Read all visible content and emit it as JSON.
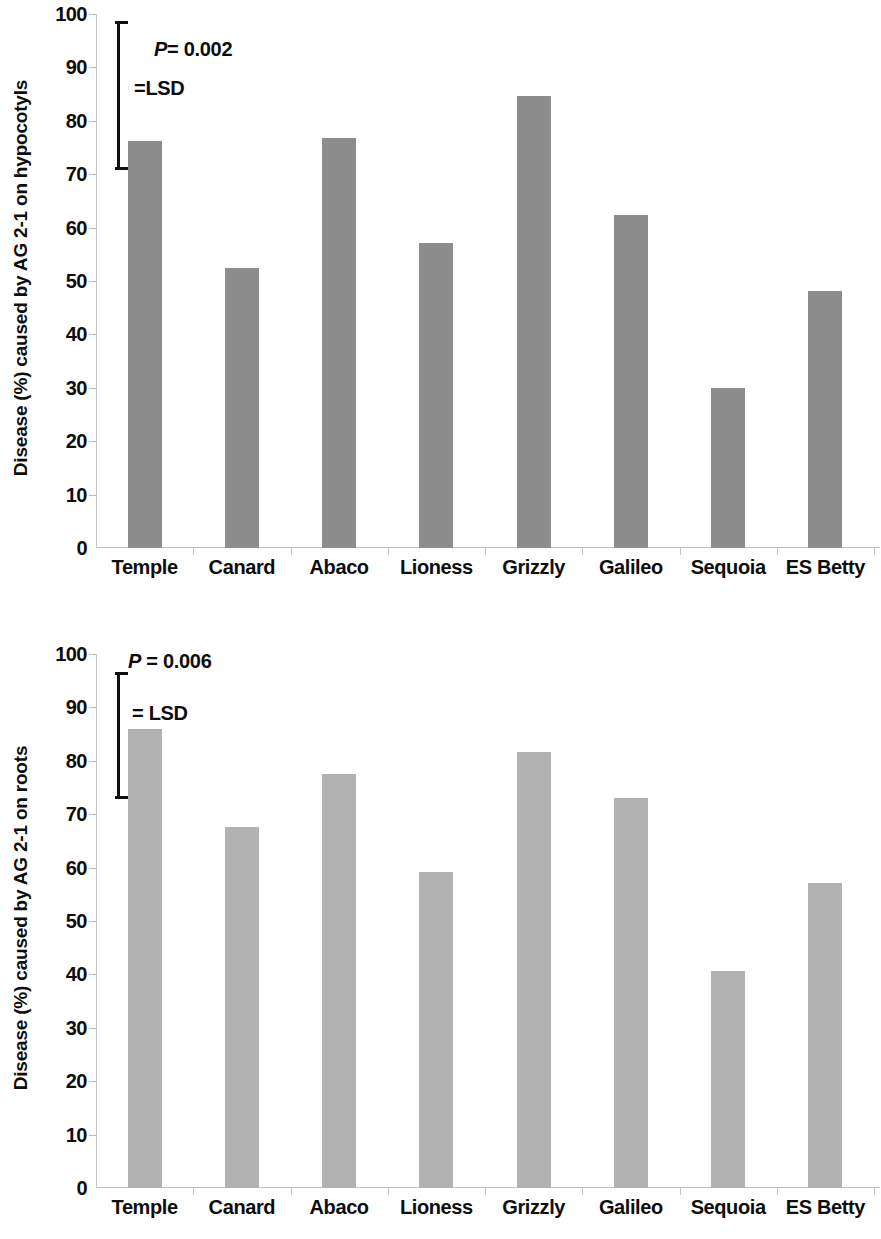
{
  "figures": [
    {
      "id": "hypocotyls",
      "ylabel": "Disease (%) caused by AG 2-1 on hypocotyls",
      "p_value_label": "P= 0.002",
      "p_italic": "P",
      "p_rest": "= 0.002",
      "lsd_label": "=LSD",
      "lsd_top": 98.5,
      "lsd_bottom": 71.2,
      "bar_color": "#8d8d8d",
      "chart_data": {
        "type": "bar",
        "title": "",
        "xlabel": "",
        "ylabel": "Disease (%) caused by AG 2-1 on hypocotyls",
        "ylim": [
          0,
          100
        ],
        "yticks": [
          0,
          10,
          20,
          30,
          40,
          50,
          60,
          70,
          80,
          90,
          100
        ],
        "grid": false,
        "legend": "none",
        "categories": [
          "Temple",
          "Canard",
          "Abaco",
          "Lioness",
          "Grizzly",
          "Galileo",
          "Sequoia",
          "ES Betty"
        ],
        "values": [
          76.2,
          52.5,
          76.7,
          57.1,
          84.7,
          62.3,
          30.0,
          48.2
        ],
        "annotations": [
          "P= 0.002",
          "=LSD"
        ]
      }
    },
    {
      "id": "roots",
      "ylabel": "Disease (%) caused by AG 2-1 on roots",
      "p_value_label": "P = 0.006",
      "p_italic": "P",
      "p_rest": "= 0.006",
      "lsd_label": "= LSD",
      "lsd_top": 96.5,
      "lsd_bottom": 73.2,
      "bar_color": "#b2b2b2",
      "chart_data": {
        "type": "bar",
        "title": "",
        "xlabel": "",
        "ylabel": "Disease (%) caused by AG 2-1 on roots",
        "ylim": [
          0,
          100
        ],
        "yticks": [
          0,
          10,
          20,
          30,
          40,
          50,
          60,
          70,
          80,
          90,
          100
        ],
        "grid": false,
        "legend": "none",
        "categories": [
          "Temple",
          "Canard",
          "Abaco",
          "Lioness",
          "Grizzly",
          "Galileo",
          "Sequoia",
          "ES Betty"
        ],
        "values": [
          86.0,
          67.6,
          77.6,
          59.1,
          81.6,
          73.0,
          40.7,
          57.2
        ],
        "annotations": [
          "P = 0.006",
          "= LSD"
        ]
      }
    }
  ]
}
